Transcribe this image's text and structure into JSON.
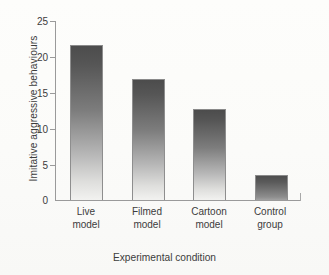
{
  "chart_data": {
    "type": "bar",
    "title": "",
    "subtitle": "",
    "xlabel": "Experimental condition",
    "ylabel": "Imitative aggressive behaviours",
    "categories": [
      "Live model",
      "Filmed model",
      "Cartoon model",
      "Control group"
    ],
    "category_lines": [
      [
        "Live",
        "model"
      ],
      [
        "Filmed",
        "model"
      ],
      [
        "Cartoon",
        "model"
      ],
      [
        "Control",
        "group"
      ]
    ],
    "values": [
      21.5,
      16.8,
      12.5,
      3.4
    ],
    "series": [
      {
        "name": "Imitative aggressive behaviours",
        "values": [
          21.5,
          16.8,
          12.5,
          3.4
        ]
      }
    ],
    "ylim": [
      0,
      25
    ],
    "xlim": [
      0,
      4
    ],
    "yticks": [
      0,
      5,
      10,
      15,
      20,
      25
    ],
    "ytick_labels": [
      "0",
      "5",
      "10",
      "15",
      "20",
      "25"
    ],
    "xticks": [],
    "grid": false,
    "legend": false,
    "legend_position": "none",
    "bar_style": {
      "gradient_top": "#4c4c4c",
      "gradient_bottom": "#f2f2f0",
      "border": "#8e8e8e"
    },
    "axis_color": "#9a9a9a",
    "text_color": "#3c3c3c",
    "background": "#fdfdfb"
  }
}
